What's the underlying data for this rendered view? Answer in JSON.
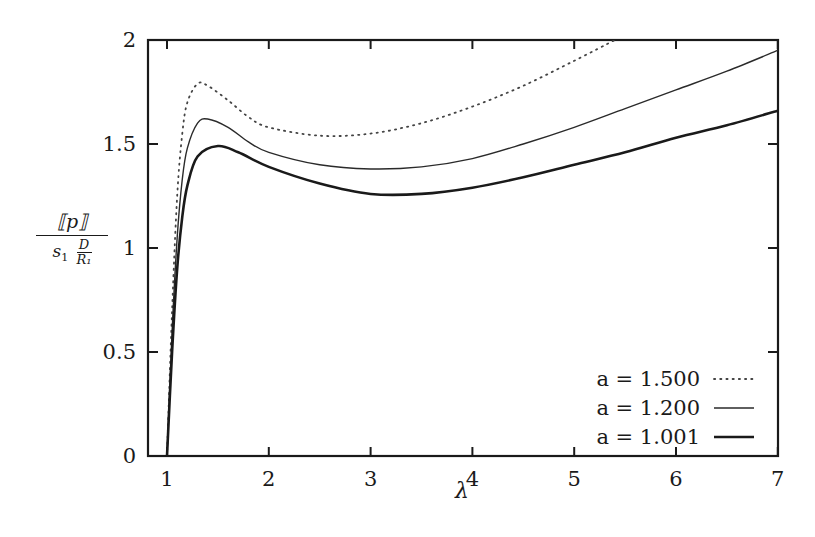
{
  "chart_data": {
    "type": "line",
    "title": "",
    "xlabel": "λ",
    "ylabel": "[[p]] / (s1 D/R1)",
    "ylabel_numerator": "⟦p⟧",
    "ylabel_denominator": "s₁ D/R₁",
    "xlim": [
      0.81,
      7
    ],
    "ylim": [
      0,
      2
    ],
    "xticks": [
      1,
      2,
      3,
      4,
      5,
      6,
      7
    ],
    "yticks": [
      0,
      0.5,
      1,
      1.5,
      2
    ],
    "xtick_labels": [
      "1",
      "2",
      "3",
      "4",
      "5",
      "6",
      "7"
    ],
    "ytick_labels": [
      "0",
      "0.5",
      "1",
      "1.5",
      "2"
    ],
    "grid": false,
    "legend_position": "lower right",
    "series": [
      {
        "name": "a = 1.500",
        "style": "dotted",
        "x": [
          1.0,
          1.05,
          1.1,
          1.15,
          1.2,
          1.3,
          1.4,
          1.6,
          1.8,
          2.0,
          2.5,
          3.0,
          3.5,
          4.0,
          4.5,
          5.0,
          5.4
        ],
        "y": [
          0.0,
          0.7,
          1.25,
          1.55,
          1.7,
          1.79,
          1.78,
          1.71,
          1.63,
          1.58,
          1.54,
          1.55,
          1.6,
          1.68,
          1.78,
          1.9,
          2.0
        ]
      },
      {
        "name": "a = 1.200",
        "style": "solid-thin",
        "x": [
          1.0,
          1.05,
          1.1,
          1.15,
          1.2,
          1.3,
          1.4,
          1.6,
          1.8,
          2.0,
          2.5,
          3.0,
          3.5,
          4.0,
          4.5,
          5.0,
          5.5,
          6.0,
          6.5,
          7.0
        ],
        "y": [
          0.0,
          0.6,
          1.05,
          1.33,
          1.48,
          1.6,
          1.62,
          1.58,
          1.51,
          1.46,
          1.4,
          1.38,
          1.39,
          1.43,
          1.5,
          1.58,
          1.67,
          1.76,
          1.85,
          1.95
        ]
      },
      {
        "name": "a = 1.001",
        "style": "solid-thick",
        "x": [
          1.0,
          1.05,
          1.1,
          1.15,
          1.2,
          1.3,
          1.5,
          1.7,
          2.0,
          2.5,
          3.0,
          3.5,
          4.0,
          4.5,
          5.0,
          5.5,
          6.0,
          6.5,
          7.0
        ],
        "y": [
          0.0,
          0.5,
          0.9,
          1.15,
          1.3,
          1.44,
          1.49,
          1.46,
          1.39,
          1.31,
          1.26,
          1.26,
          1.29,
          1.34,
          1.4,
          1.46,
          1.53,
          1.59,
          1.66
        ]
      }
    ]
  },
  "legend": {
    "items": [
      {
        "label": "a = 1.500",
        "style": "dotted"
      },
      {
        "label": "a = 1.200",
        "style": "thin"
      },
      {
        "label": "a = 1.001",
        "style": "thick"
      }
    ]
  },
  "axes": {
    "x_label": "λ",
    "y_label_num": "⟦p⟧",
    "y_label_den_s": "s",
    "y_label_den_sub": "1",
    "y_label_den_frac_num": "D",
    "y_label_den_frac_den": "R₁"
  }
}
